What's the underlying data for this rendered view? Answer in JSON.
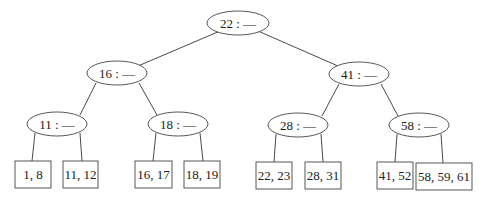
{
  "diagram": {
    "type": "B-tree",
    "internal_nodes": [
      {
        "id": "root",
        "label": "22 : —",
        "cx": 238,
        "cy": 23
      },
      {
        "id": "n16",
        "label": "16 : —",
        "cx": 117,
        "cy": 73
      },
      {
        "id": "n41",
        "label": "41 : —",
        "cx": 359,
        "cy": 74
      },
      {
        "id": "n11",
        "label": "11 : —",
        "cx": 57,
        "cy": 124
      },
      {
        "id": "n18",
        "label": "18 : —",
        "cx": 178,
        "cy": 124
      },
      {
        "id": "n28",
        "label": "28 : —",
        "cx": 298,
        "cy": 125
      },
      {
        "id": "n58",
        "label": "58 : —",
        "cx": 419,
        "cy": 125
      }
    ],
    "leaves": [
      {
        "id": "l1",
        "label": "1, 8",
        "x": 15,
        "w": 36,
        "parent": "n11"
      },
      {
        "id": "l2",
        "label": "11, 12",
        "x": 63,
        "w": 35,
        "parent": "n11"
      },
      {
        "id": "l3",
        "label": "16, 17",
        "x": 135,
        "w": 37,
        "parent": "n18"
      },
      {
        "id": "l4",
        "label": "18, 19",
        "x": 184,
        "w": 36,
        "parent": "n18"
      },
      {
        "id": "l5",
        "label": "22, 23",
        "x": 256,
        "w": 36,
        "parent": "n28"
      },
      {
        "id": "l6",
        "label": "28, 31",
        "x": 305,
        "w": 36,
        "parent": "n28"
      },
      {
        "id": "l7",
        "label": "41, 52",
        "x": 377,
        "w": 36,
        "parent": "n58"
      },
      {
        "id": "l8",
        "label": "58, 59, 61",
        "x": 416,
        "w": 56,
        "parent": "n58"
      }
    ],
    "edges": [
      [
        "root",
        "n16"
      ],
      [
        "root",
        "n41"
      ],
      [
        "n16",
        "n11"
      ],
      [
        "n16",
        "n18"
      ],
      [
        "n41",
        "n28"
      ],
      [
        "n41",
        "n58"
      ],
      [
        "n11",
        "l1"
      ],
      [
        "n11",
        "l2"
      ],
      [
        "n18",
        "l3"
      ],
      [
        "n18",
        "l4"
      ],
      [
        "n28",
        "l5"
      ],
      [
        "n28",
        "l6"
      ],
      [
        "n58",
        "l7"
      ],
      [
        "n58",
        "l8"
      ]
    ]
  }
}
